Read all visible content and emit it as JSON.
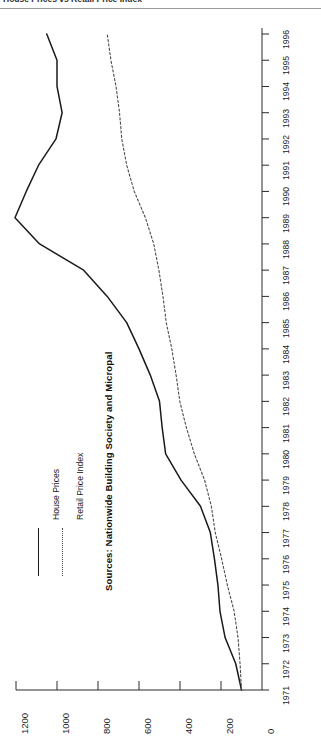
{
  "header": {
    "clipped_title": "House Prices vs Retail Price Index"
  },
  "caption": {
    "text": "Sources: Nationwide Building Society and Micropal"
  },
  "legend": {
    "items": [
      {
        "label": "House Prices",
        "style": "solid",
        "color": "#1a1a1a"
      },
      {
        "label": "Retail Price Index",
        "style": "dashed",
        "color": "#4a4a4a"
      }
    ]
  },
  "chart_data": {
    "type": "line",
    "title": "House Prices vs Retail Price Index",
    "orientation": "rotated-90",
    "xlabel": "",
    "ylabel": "",
    "grid": false,
    "legend_position": "left",
    "xlim": [
      1971,
      1996
    ],
    "ylim": [
      0,
      1200
    ],
    "x": [
      1971,
      1972,
      1973,
      1974,
      1975,
      1976,
      1977,
      1978,
      1979,
      1980,
      1981,
      1982,
      1983,
      1984,
      1985,
      1986,
      1987,
      1988,
      1989,
      1990,
      1991,
      1992,
      1993,
      1994,
      1995,
      1996
    ],
    "categories": [
      "1971",
      "1972",
      "1973",
      "1974",
      "1975",
      "1976",
      "1977",
      "1978",
      "1979",
      "1980",
      "1981",
      "1982",
      "1983",
      "1984",
      "1985",
      "1986",
      "1987",
      "1988",
      "1989",
      "1990",
      "1991",
      "1992",
      "1993",
      "1994",
      "1995",
      "1996"
    ],
    "ytick_labels": [
      "1200",
      "1000",
      "800",
      "600",
      "400",
      "200",
      "0"
    ],
    "ytick_values": [
      1200,
      1000,
      800,
      600,
      400,
      200,
      0
    ],
    "series": [
      {
        "name": "House Prices",
        "style": "solid",
        "color": "#1a1a1a",
        "values": [
          100,
          128,
          180,
          205,
          215,
          232,
          252,
          300,
          395,
          470,
          487,
          500,
          545,
          600,
          660,
          755,
          870,
          1085,
          1205,
          1150,
          1090,
          1005,
          975,
          1000,
          1000,
          1050
        ]
      },
      {
        "name": "Retail Price Index",
        "style": "dashed",
        "color": "#4a4a4a",
        "values": [
          100,
          107,
          117,
          136,
          169,
          197,
          228,
          247,
          280,
          330,
          369,
          401,
          419,
          440,
          467,
          483,
          503,
          528,
          569,
          623,
          660,
          684,
          695,
          712,
          737,
          755
        ]
      }
    ]
  }
}
